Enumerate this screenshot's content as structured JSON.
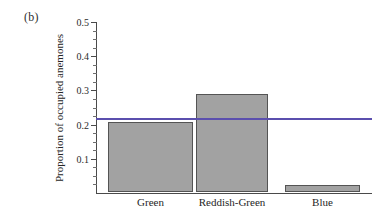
{
  "figure": {
    "panel_label": "(b)",
    "ylabel": "Proportion of occupied anemones"
  },
  "axis": {
    "y_ticks": [
      "0.1",
      "0.2",
      "0.3",
      "0.4",
      "0.5"
    ],
    "x_categories": [
      "Green",
      "Reddish-Green",
      "Blue"
    ]
  },
  "colors": {
    "bar_fill": "#a2a2a2",
    "bar_edge": "#545454",
    "reference_line": "#5b4fae",
    "axis": "#4a4a4a",
    "text": "#262626"
  },
  "chart_data": {
    "type": "bar",
    "title": "",
    "subtitle": "",
    "xlabel": "",
    "ylabel": "Proportion of occupied anemones",
    "categories": [
      "Green",
      "Reddish-Green",
      "Blue"
    ],
    "values": [
      0.205,
      0.287,
      0.021
    ],
    "ylim": [
      0,
      0.5
    ],
    "xlim_note": "categorical",
    "y_major_ticks": [
      0.1,
      0.2,
      0.3,
      0.4,
      0.5
    ],
    "y_minor_tick_interval": 0.025,
    "y_tick_labels": [
      "0.1",
      "0.2",
      "0.3",
      "0.4",
      "0.5"
    ],
    "grid": false,
    "legend": null,
    "legend_position": "none",
    "annotations": [
      {
        "type": "horizontal-reference-line",
        "value": 0.217,
        "color": "#5b4fae",
        "label": "",
        "spans": "full plot width"
      }
    ],
    "panel_label": "(b)",
    "bar_fill_color": "#a2a2a2",
    "bar_edge_color": "#545454"
  }
}
